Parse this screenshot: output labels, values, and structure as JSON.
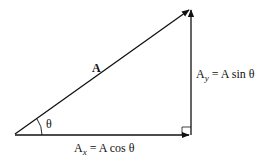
{
  "diagram": {
    "type": "vector-components",
    "labels": {
      "vector": "A",
      "angle": "θ",
      "x_component_prefix": "A",
      "x_component_sub": "x",
      "x_component_rest": " = A cos θ",
      "y_component_prefix": "A",
      "y_component_sub": "y",
      "y_component_rest": " = A sin θ"
    },
    "colors": {
      "stroke": "#111111",
      "background": "#ffffff"
    }
  }
}
